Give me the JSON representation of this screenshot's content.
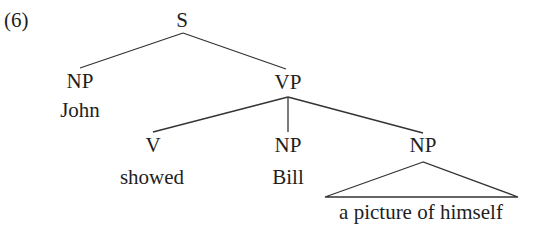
{
  "example_number": "(6)",
  "tree": {
    "root": {
      "label": "S"
    },
    "subject": {
      "label": "NP",
      "word": "John"
    },
    "predicate": {
      "label": "VP"
    },
    "verb": {
      "label": "V",
      "word": "showed"
    },
    "object1": {
      "label": "NP",
      "word": "Bill"
    },
    "object2": {
      "label": "NP",
      "phrase": "a picture of himself",
      "collapsed": true
    }
  },
  "colors": {
    "line": "#333333",
    "text": "#1e1e1e",
    "background": "#ffffff"
  }
}
